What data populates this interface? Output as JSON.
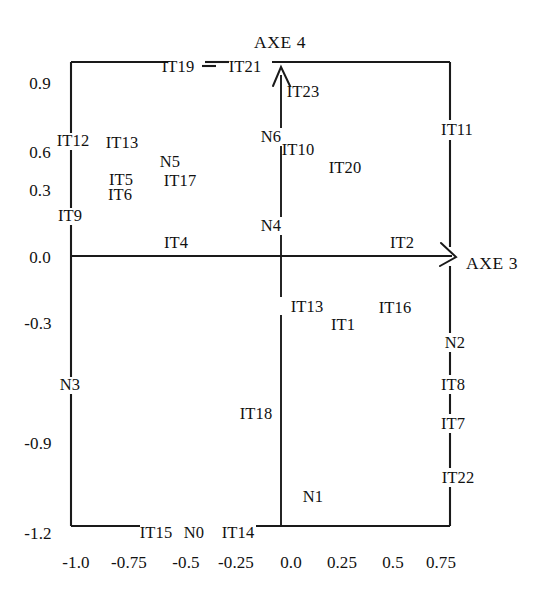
{
  "figure": {
    "background_color": "#ffffff",
    "ink_color": "#111111",
    "axis_titles": {
      "vertical": "AXE  4",
      "horizontal": "AXE 3"
    }
  },
  "chart_data": {
    "type": "scatter",
    "title": "",
    "xlabel": "AXE 3",
    "ylabel": "AXE  4",
    "grid": false,
    "legend": null,
    "xlim": [
      -1.15,
      0.92
    ],
    "ylim": [
      -1.2,
      0.95
    ],
    "xticks": [
      "-1.0",
      "-0.75",
      "-0.5",
      "-0.25",
      "0.0",
      "0.25",
      "0.5",
      "0.75"
    ],
    "xtick_values": [
      -1.0,
      -0.75,
      -0.5,
      -0.25,
      0.0,
      0.25,
      0.5,
      0.75
    ],
    "yticks": [
      "0.9",
      "0.6",
      "0.3",
      "0.0",
      "-0.3",
      "-0.9",
      "-1.2"
    ],
    "ytick_values": [
      0.9,
      0.6,
      0.3,
      0.0,
      -0.3,
      -0.9,
      -1.2
    ],
    "points": [
      {
        "label": "IT19",
        "x": -0.52,
        "y": 0.93
      },
      {
        "label": "IT21",
        "x": -0.27,
        "y": 0.93
      },
      {
        "label": "IT23",
        "x": 0.09,
        "y": 0.82
      },
      {
        "label": "IT11",
        "x": 0.79,
        "y": 0.63
      },
      {
        "label": "IT12",
        "x": -0.93,
        "y": 0.64
      },
      {
        "label": "IT13",
        "x": -0.73,
        "y": 0.58
      },
      {
        "label": "N5",
        "x": -0.51,
        "y": 0.5
      },
      {
        "label": "N6",
        "x": -0.04,
        "y": 0.58
      },
      {
        "label": "IT10",
        "x": 0.07,
        "y": 0.52
      },
      {
        "label": "IT20",
        "x": 0.29,
        "y": 0.43
      },
      {
        "label": "IT5",
        "x": -0.74,
        "y": 0.42
      },
      {
        "label": "IT17",
        "x": -0.47,
        "y": 0.42
      },
      {
        "label": "IT6",
        "x": -0.75,
        "y": 0.35
      },
      {
        "label": "IT9",
        "x": -0.93,
        "y": 0.22
      },
      {
        "label": "N4",
        "x": -0.04,
        "y": 0.17
      },
      {
        "label": "IT4",
        "x": -0.46,
        "y": 0.06
      },
      {
        "label": "IT2",
        "x": 0.55,
        "y": 0.07
      },
      {
        "label": "IT13",
        "x": 0.12,
        "y": -0.22
      },
      {
        "label": "IT16",
        "x": 0.51,
        "y": -0.23
      },
      {
        "label": "IT1",
        "x": 0.28,
        "y": -0.31
      },
      {
        "label": "N2",
        "x": 0.78,
        "y": -0.39
      },
      {
        "label": "N3",
        "x": -0.94,
        "y": -0.58
      },
      {
        "label": "IT8",
        "x": 0.77,
        "y": -0.58
      },
      {
        "label": "IT18",
        "x": -0.08,
        "y": -0.71
      },
      {
        "label": "IT7",
        "x": 0.77,
        "y": -0.76
      },
      {
        "label": "IT22",
        "x": 0.79,
        "y": -1.0
      },
      {
        "label": "N1",
        "x": 0.14,
        "y": -1.08
      },
      {
        "label": "IT15",
        "x": -0.57,
        "y": -1.21
      },
      {
        "label": "N0",
        "x": -0.4,
        "y": -1.21
      },
      {
        "label": "IT14",
        "x": -0.2,
        "y": -1.21
      }
    ]
  },
  "labels": {
    "axe4": "AXE  4",
    "axe3": "AXE 3",
    "points": [
      {
        "name": "IT19",
        "left": 178,
        "top": 67
      },
      {
        "name": "IT21",
        "left": 245,
        "top": 67
      },
      {
        "name": "IT23",
        "left": 303,
        "top": 92
      },
      {
        "name": "IT11",
        "left": 457,
        "top": 130
      },
      {
        "name": "IT12",
        "left": 73,
        "top": 141
      },
      {
        "name": "IT13",
        "left": 122,
        "top": 143
      },
      {
        "name": "N5",
        "left": 170,
        "top": 162
      },
      {
        "name": "N6",
        "left": 271,
        "top": 137
      },
      {
        "name": "IT10",
        "left": 298,
        "top": 150
      },
      {
        "name": "IT20",
        "left": 345,
        "top": 168
      },
      {
        "name": "IT5",
        "left": 121,
        "top": 180
      },
      {
        "name": "IT17",
        "left": 180,
        "top": 181
      },
      {
        "name": "IT6",
        "left": 120,
        "top": 195
      },
      {
        "name": "IT9",
        "left": 70,
        "top": 216
      },
      {
        "name": "N4",
        "left": 271,
        "top": 226
      },
      {
        "name": "IT4",
        "left": 176,
        "top": 243
      },
      {
        "name": "IT2",
        "left": 402,
        "top": 243
      },
      {
        "name": "IT13",
        "left": 307,
        "top": 307
      },
      {
        "name": "IT16",
        "left": 395,
        "top": 308
      },
      {
        "name": "IT1",
        "left": 343,
        "top": 325
      },
      {
        "name": "N2",
        "left": 455,
        "top": 343
      },
      {
        "name": "N3",
        "left": 70,
        "top": 385
      },
      {
        "name": "IT8",
        "left": 453,
        "top": 385
      },
      {
        "name": "IT18",
        "left": 256,
        "top": 414
      },
      {
        "name": "IT7",
        "left": 453,
        "top": 424
      },
      {
        "name": "IT22",
        "left": 458,
        "top": 478
      },
      {
        "name": "N1",
        "left": 313,
        "top": 497
      },
      {
        "name": "IT15",
        "left": 156,
        "top": 533
      },
      {
        "name": "N0",
        "left": 194,
        "top": 533
      },
      {
        "name": "IT14",
        "left": 238,
        "top": 533
      }
    ],
    "yticks": [
      {
        "text": "0.9",
        "left": 40,
        "top": 83
      },
      {
        "text": "0.6",
        "left": 40,
        "top": 152
      },
      {
        "text": "0.3",
        "left": 40,
        "top": 190
      },
      {
        "text": "0.0",
        "left": 40,
        "top": 257
      },
      {
        "text": "-0.3",
        "left": 38,
        "top": 323
      },
      {
        "text": "-0.9",
        "left": 38,
        "top": 443
      },
      {
        "text": "-1.2",
        "left": 38,
        "top": 533
      }
    ],
    "xticks": [
      {
        "text": "-1.0",
        "left": 76,
        "top": 562
      },
      {
        "text": "-0.75",
        "left": 129,
        "top": 562
      },
      {
        "text": "-0.5",
        "left": 186,
        "top": 562
      },
      {
        "text": "-0.25",
        "left": 236,
        "top": 562
      },
      {
        "text": "0.0",
        "left": 291,
        "top": 562
      },
      {
        "text": "0.25",
        "left": 342,
        "top": 562
      },
      {
        "text": "0.5",
        "left": 393,
        "top": 562
      },
      {
        "text": "0.75",
        "left": 441,
        "top": 562
      }
    ]
  }
}
